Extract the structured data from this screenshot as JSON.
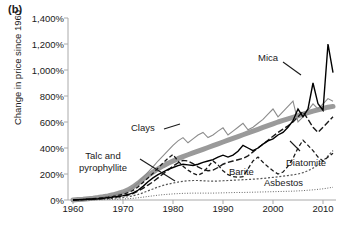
{
  "panel": {
    "label": "(b)"
  },
  "axes": {
    "ylabel": "Change in price since 1960",
    "yticks": [
      "1,400%",
      "1,200%",
      "1,000%",
      "800%",
      "600%",
      "400%",
      "200%",
      "0%"
    ],
    "ytick_values": [
      1400,
      1200,
      1000,
      800,
      600,
      400,
      200,
      0
    ],
    "xticks": [
      "1960",
      "1970",
      "1980",
      "1990",
      "2000",
      "2010"
    ],
    "xtick_values": [
      1960,
      1970,
      1980,
      1990,
      2000,
      2010
    ]
  },
  "annotations": [
    {
      "name": "mica",
      "text": "Mica"
    },
    {
      "name": "clays",
      "text": "Clays"
    },
    {
      "name": "talc",
      "line1": "Talc and",
      "line2": "pyrophyllite"
    },
    {
      "name": "barite",
      "text": "Barite"
    },
    {
      "name": "asbestos",
      "text": "Asbestos"
    },
    {
      "name": "diatomite",
      "text": "Diatomite"
    }
  ],
  "colors": {
    "axis": "#aaaaaa",
    "text": "#1a1a1a",
    "mica": "#000000",
    "clays": "#8c8c8c",
    "talc": "#9a9a9a",
    "barite": "#1a1a1a",
    "asbestos": "#1a1a1a",
    "diatomite": "#555555"
  },
  "chart_data": {
    "type": "line",
    "title": "",
    "xlabel": "",
    "ylabel": "Change in price since 1960",
    "xlim": [
      1960,
      2013
    ],
    "ylim": [
      0,
      1400
    ],
    "grid": false,
    "legend": "annotations-inline",
    "x": [
      1960,
      1961,
      1962,
      1963,
      1964,
      1965,
      1966,
      1967,
      1968,
      1969,
      1970,
      1971,
      1972,
      1973,
      1974,
      1975,
      1976,
      1977,
      1978,
      1979,
      1980,
      1981,
      1982,
      1983,
      1984,
      1985,
      1986,
      1987,
      1988,
      1989,
      1990,
      1991,
      1992,
      1993,
      1994,
      1995,
      1996,
      1997,
      1998,
      1999,
      2000,
      2001,
      2002,
      2003,
      2004,
      2005,
      2006,
      2007,
      2008,
      2009,
      2010,
      2011,
      2012
    ],
    "series": [
      {
        "name": "Mica",
        "style": "solid-thin-black",
        "values": [
          0,
          2,
          4,
          6,
          8,
          10,
          14,
          18,
          22,
          28,
          34,
          42,
          55,
          75,
          105,
          140,
          170,
          195,
          215,
          235,
          250,
          265,
          275,
          270,
          265,
          275,
          290,
          300,
          310,
          330,
          345,
          330,
          345,
          375,
          420,
          400,
          380,
          400,
          430,
          455,
          470,
          500,
          520,
          560,
          610,
          700,
          640,
          700,
          900,
          740,
          690,
          1200,
          980
        ]
      },
      {
        "name": "Clays",
        "style": "solid-thin-gray",
        "values": [
          0,
          3,
          6,
          9,
          13,
          17,
          22,
          28,
          36,
          45,
          55,
          70,
          95,
          130,
          175,
          215,
          255,
          300,
          340,
          380,
          420,
          455,
          480,
          440,
          470,
          500,
          520,
          480,
          500,
          530,
          555,
          500,
          530,
          560,
          590,
          540,
          560,
          590,
          620,
          660,
          700,
          640,
          680,
          720,
          760,
          600,
          640,
          690,
          740,
          700,
          740,
          780,
          760
        ]
      },
      {
        "name": "Talc and pyrophyllite",
        "style": "thick-gray-band",
        "values": [
          0,
          3,
          6,
          10,
          14,
          19,
          25,
          32,
          40,
          50,
          62,
          78,
          100,
          128,
          160,
          190,
          215,
          240,
          262,
          282,
          300,
          318,
          334,
          348,
          362,
          376,
          390,
          404,
          418,
          432,
          446,
          460,
          474,
          488,
          502,
          516,
          530,
          544,
          558,
          572,
          586,
          600,
          612,
          624,
          636,
          648,
          660,
          672,
          684,
          694,
          704,
          714,
          720
        ]
      },
      {
        "name": "Barite",
        "style": "dashed-black",
        "values": [
          0,
          2,
          4,
          7,
          10,
          13,
          17,
          22,
          28,
          35,
          44,
          56,
          74,
          100,
          135,
          170,
          205,
          245,
          285,
          320,
          350,
          300,
          260,
          230,
          205,
          190,
          210,
          255,
          300,
          270,
          225,
          195,
          180,
          175,
          180,
          240,
          300,
          330,
          290,
          255,
          225,
          200,
          215,
          260,
          320,
          400,
          460,
          420,
          380,
          330,
          300,
          330,
          360
        ]
      },
      {
        "name": "Asbestos",
        "style": "dashed-black-long",
        "values": [
          0,
          2,
          3,
          5,
          7,
          9,
          12,
          15,
          19,
          24,
          30,
          38,
          50,
          68,
          90,
          115,
          140,
          170,
          200,
          230,
          260,
          285,
          305,
          300,
          280,
          255,
          235,
          225,
          230,
          250,
          275,
          290,
          300,
          310,
          320,
          340,
          370,
          400,
          430,
          460,
          490,
          520,
          545,
          570,
          600,
          640,
          680,
          620,
          560,
          520,
          560,
          600,
          640
        ]
      },
      {
        "name": "Diatomite",
        "style": "dotted-fine",
        "values": [
          0,
          1,
          2,
          3,
          4,
          6,
          8,
          10,
          13,
          16,
          20,
          25,
          32,
          42,
          55,
          70,
          85,
          100,
          112,
          122,
          130,
          138,
          144,
          148,
          150,
          150,
          148,
          146,
          145,
          146,
          148,
          150,
          152,
          154,
          156,
          158,
          160,
          163,
          166,
          170,
          174,
          178,
          183,
          188,
          194,
          200,
          210,
          225,
          245,
          270,
          300,
          340,
          380
        ]
      },
      {
        "name": "Low dotted series",
        "style": "dotted-very-fine",
        "values": [
          0,
          0,
          1,
          1,
          2,
          2,
          3,
          4,
          5,
          6,
          8,
          10,
          13,
          17,
          22,
          27,
          32,
          37,
          41,
          44,
          47,
          49,
          51,
          52,
          53,
          53,
          53,
          53,
          53,
          54,
          55,
          56,
          57,
          58,
          58,
          59,
          60,
          61,
          62,
          63,
          64,
          65,
          66,
          67,
          68,
          70,
          72,
          75,
          78,
          82,
          86,
          92,
          98
        ]
      }
    ]
  }
}
